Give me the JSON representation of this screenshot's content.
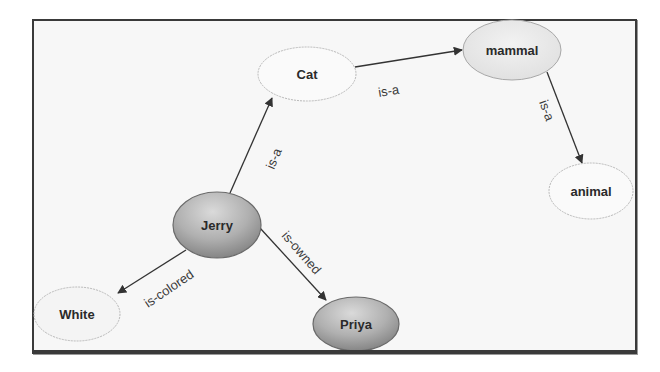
{
  "diagram": {
    "type": "semantic-network",
    "colors": {
      "frame_border": "#3a3a3a",
      "frame_background": "#f7f7f7",
      "light_node_fill": "#f9f9f9",
      "light_node_stroke": "#b5b5b5",
      "dark_node_fill_top": "#d6d6d6",
      "dark_node_fill_bottom": "#8c8c8c",
      "dark_node_stroke": "#6a6a6a",
      "edge": "#333333"
    },
    "nodes": [
      {
        "id": "cat",
        "label": "Cat",
        "style": "light"
      },
      {
        "id": "mammal",
        "label": "mammal",
        "style": "light-gray"
      },
      {
        "id": "animal",
        "label": "animal",
        "style": "light"
      },
      {
        "id": "jerry",
        "label": "Jerry",
        "style": "dark"
      },
      {
        "id": "white",
        "label": "White",
        "style": "light"
      },
      {
        "id": "priya",
        "label": "Priya",
        "style": "dark"
      }
    ],
    "edges": [
      {
        "from": "jerry",
        "to": "cat",
        "label": "is-a"
      },
      {
        "from": "cat",
        "to": "mammal",
        "label": "is-a"
      },
      {
        "from": "mammal",
        "to": "animal",
        "label": "is-a"
      },
      {
        "from": "jerry",
        "to": "white",
        "label": "is-colored"
      },
      {
        "from": "jerry",
        "to": "priya",
        "label": "is-owned"
      }
    ]
  }
}
